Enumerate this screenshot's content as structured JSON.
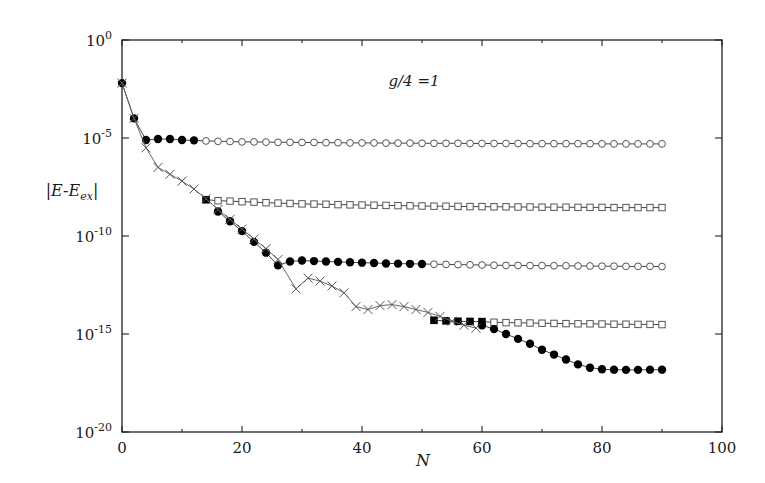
{
  "chart_data": {
    "type": "scatter",
    "title": "",
    "xlabel": "N",
    "ylabel": "|E-E_ex|",
    "ylabel_parts": {
      "main": "|E-E",
      "sub": "ex",
      "end": "|"
    },
    "annotation": "g/4 =1",
    "yscale": "log",
    "xlim": [
      0,
      100
    ],
    "ylim": [
      1e-20,
      1
    ],
    "x_ticks": [
      0,
      20,
      40,
      60,
      80,
      100
    ],
    "x_tick_labels": [
      "0",
      "20",
      "40",
      "60",
      "80",
      "100"
    ],
    "y_ticks_log10": [
      0,
      -5,
      -10,
      -15,
      -20
    ],
    "y_tick_labels": [
      {
        "base": "10",
        "exp": "0"
      },
      {
        "base": "10",
        "exp": "-5"
      },
      {
        "base": "10",
        "exp": "-10"
      },
      {
        "base": "10",
        "exp": "-15"
      },
      {
        "base": "10",
        "exp": "-20"
      }
    ],
    "grid": false,
    "legend": "none",
    "series": [
      {
        "name": "branch-1 (circles, plateau ~1e-5)",
        "marker": "circle",
        "line": true,
        "points_log10": [
          [
            0,
            -2.2,
            "filled"
          ],
          [
            2,
            -4.0,
            "filled"
          ],
          [
            4,
            -5.1,
            "filled"
          ],
          [
            6,
            -5.05,
            "filled"
          ],
          [
            8,
            -5.05,
            "filled"
          ],
          [
            10,
            -5.1,
            "filled"
          ],
          [
            12,
            -5.12,
            "filled"
          ],
          [
            14,
            -5.15,
            "open"
          ],
          [
            16,
            -5.17,
            "open"
          ],
          [
            18,
            -5.18,
            "open"
          ],
          [
            20,
            -5.2,
            "open"
          ],
          [
            22,
            -5.2,
            "open"
          ],
          [
            24,
            -5.21,
            "open"
          ],
          [
            26,
            -5.22,
            "open"
          ],
          [
            28,
            -5.22,
            "open"
          ],
          [
            30,
            -5.23,
            "open"
          ],
          [
            32,
            -5.23,
            "open"
          ],
          [
            34,
            -5.24,
            "open"
          ],
          [
            36,
            -5.24,
            "open"
          ],
          [
            38,
            -5.25,
            "open"
          ],
          [
            40,
            -5.25,
            "open"
          ],
          [
            42,
            -5.25,
            "open"
          ],
          [
            44,
            -5.26,
            "open"
          ],
          [
            46,
            -5.26,
            "open"
          ],
          [
            48,
            -5.26,
            "open"
          ],
          [
            50,
            -5.27,
            "open"
          ],
          [
            52,
            -5.27,
            "open"
          ],
          [
            54,
            -5.27,
            "open"
          ],
          [
            56,
            -5.27,
            "open"
          ],
          [
            58,
            -5.28,
            "open"
          ],
          [
            60,
            -5.28,
            "open"
          ],
          [
            62,
            -5.28,
            "open"
          ],
          [
            64,
            -5.28,
            "open"
          ],
          [
            66,
            -5.28,
            "open"
          ],
          [
            68,
            -5.29,
            "open"
          ],
          [
            70,
            -5.29,
            "open"
          ],
          [
            72,
            -5.29,
            "open"
          ],
          [
            74,
            -5.29,
            "open"
          ],
          [
            76,
            -5.29,
            "open"
          ],
          [
            78,
            -5.29,
            "open"
          ],
          [
            80,
            -5.3,
            "open"
          ],
          [
            82,
            -5.3,
            "open"
          ],
          [
            84,
            -5.3,
            "open"
          ],
          [
            86,
            -5.3,
            "open"
          ],
          [
            88,
            -5.3,
            "open"
          ],
          [
            90,
            -5.3,
            "open"
          ]
        ]
      },
      {
        "name": "branch-2 (squares, plateau ~1e-8)",
        "marker": "square",
        "line": true,
        "points_log10": [
          [
            14,
            -8.15,
            "filled"
          ],
          [
            16,
            -8.2,
            "open"
          ],
          [
            18,
            -8.22,
            "open"
          ],
          [
            20,
            -8.25,
            "open"
          ],
          [
            22,
            -8.27,
            "open"
          ],
          [
            24,
            -8.3,
            "open"
          ],
          [
            26,
            -8.32,
            "open"
          ],
          [
            28,
            -8.34,
            "open"
          ],
          [
            30,
            -8.36,
            "open"
          ],
          [
            32,
            -8.37,
            "open"
          ],
          [
            34,
            -8.38,
            "open"
          ],
          [
            36,
            -8.4,
            "open"
          ],
          [
            38,
            -8.41,
            "open"
          ],
          [
            40,
            -8.42,
            "open"
          ],
          [
            42,
            -8.43,
            "open"
          ],
          [
            44,
            -8.44,
            "open"
          ],
          [
            46,
            -8.45,
            "open"
          ],
          [
            48,
            -8.46,
            "open"
          ],
          [
            50,
            -8.47,
            "open"
          ],
          [
            52,
            -8.48,
            "open"
          ],
          [
            54,
            -8.48,
            "open"
          ],
          [
            56,
            -8.49,
            "open"
          ],
          [
            58,
            -8.5,
            "open"
          ],
          [
            60,
            -8.5,
            "open"
          ],
          [
            62,
            -8.51,
            "open"
          ],
          [
            64,
            -8.51,
            "open"
          ],
          [
            66,
            -8.52,
            "open"
          ],
          [
            68,
            -8.52,
            "open"
          ],
          [
            70,
            -8.53,
            "open"
          ],
          [
            72,
            -8.53,
            "open"
          ],
          [
            74,
            -8.53,
            "open"
          ],
          [
            76,
            -8.54,
            "open"
          ],
          [
            78,
            -8.54,
            "open"
          ],
          [
            80,
            -8.54,
            "open"
          ],
          [
            82,
            -8.55,
            "open"
          ],
          [
            84,
            -8.55,
            "open"
          ],
          [
            86,
            -8.55,
            "open"
          ],
          [
            88,
            -8.55,
            "open"
          ],
          [
            90,
            -8.55,
            "open"
          ]
        ]
      },
      {
        "name": "branch-3 (circles, plateau ~1e-11.5)",
        "marker": "circle",
        "line": true,
        "points_log10": [
          [
            16,
            -8.75,
            "filled"
          ],
          [
            18,
            -9.25,
            "filled"
          ],
          [
            20,
            -9.75,
            "filled"
          ],
          [
            22,
            -10.3,
            "filled"
          ],
          [
            24,
            -10.85,
            "filled"
          ],
          [
            26,
            -11.5,
            "filled"
          ],
          [
            28,
            -11.3,
            "filled"
          ],
          [
            30,
            -11.25,
            "filled"
          ],
          [
            32,
            -11.28,
            "filled"
          ],
          [
            34,
            -11.3,
            "filled"
          ],
          [
            36,
            -11.32,
            "filled"
          ],
          [
            38,
            -11.34,
            "filled"
          ],
          [
            40,
            -11.36,
            "filled"
          ],
          [
            42,
            -11.38,
            "filled"
          ],
          [
            44,
            -11.4,
            "filled"
          ],
          [
            46,
            -11.41,
            "filled"
          ],
          [
            48,
            -11.42,
            "filled"
          ],
          [
            50,
            -11.43,
            "filled"
          ],
          [
            52,
            -11.44,
            "open"
          ],
          [
            54,
            -11.45,
            "open"
          ],
          [
            56,
            -11.46,
            "open"
          ],
          [
            58,
            -11.47,
            "open"
          ],
          [
            60,
            -11.48,
            "open"
          ],
          [
            62,
            -11.49,
            "open"
          ],
          [
            64,
            -11.5,
            "open"
          ],
          [
            66,
            -11.5,
            "open"
          ],
          [
            68,
            -11.51,
            "open"
          ],
          [
            70,
            -11.51,
            "open"
          ],
          [
            72,
            -11.52,
            "open"
          ],
          [
            74,
            -11.52,
            "open"
          ],
          [
            76,
            -11.53,
            "open"
          ],
          [
            78,
            -11.53,
            "open"
          ],
          [
            80,
            -11.54,
            "open"
          ],
          [
            82,
            -11.54,
            "open"
          ],
          [
            84,
            -11.55,
            "open"
          ],
          [
            86,
            -11.55,
            "open"
          ],
          [
            88,
            -11.55,
            "open"
          ],
          [
            90,
            -11.56,
            "open"
          ]
        ]
      },
      {
        "name": "branch-4 (squares, plateau ~1e-14.5)",
        "marker": "square",
        "line": true,
        "points_log10": [
          [
            52,
            -14.3,
            "filled"
          ],
          [
            54,
            -14.33,
            "filled"
          ],
          [
            56,
            -14.35,
            "filled"
          ],
          [
            58,
            -14.36,
            "filled"
          ],
          [
            60,
            -14.37,
            "filled"
          ],
          [
            62,
            -14.4,
            "open"
          ],
          [
            64,
            -14.42,
            "open"
          ],
          [
            66,
            -14.43,
            "open"
          ],
          [
            68,
            -14.44,
            "open"
          ],
          [
            70,
            -14.45,
            "open"
          ],
          [
            72,
            -14.46,
            "open"
          ],
          [
            74,
            -14.47,
            "open"
          ],
          [
            76,
            -14.48,
            "open"
          ],
          [
            78,
            -14.48,
            "open"
          ],
          [
            80,
            -14.49,
            "open"
          ],
          [
            82,
            -14.5,
            "open"
          ],
          [
            84,
            -14.5,
            "open"
          ],
          [
            86,
            -14.51,
            "open"
          ],
          [
            88,
            -14.51,
            "open"
          ],
          [
            90,
            -14.52,
            "open"
          ]
        ]
      },
      {
        "name": "branch-5 (circles, converging ~1e-16.8)",
        "marker": "circle",
        "line": true,
        "points_log10": [
          [
            60,
            -14.55,
            "filled"
          ],
          [
            62,
            -14.75,
            "filled"
          ],
          [
            64,
            -15.0,
            "filled"
          ],
          [
            66,
            -15.25,
            "filled"
          ],
          [
            68,
            -15.5,
            "filled"
          ],
          [
            70,
            -15.8,
            "filled"
          ],
          [
            72,
            -16.05,
            "filled"
          ],
          [
            74,
            -16.3,
            "filled"
          ],
          [
            76,
            -16.55,
            "filled"
          ],
          [
            78,
            -16.72,
            "filled"
          ],
          [
            80,
            -16.8,
            "filled"
          ],
          [
            82,
            -16.82,
            "filled"
          ],
          [
            84,
            -16.83,
            "filled"
          ],
          [
            86,
            -16.83,
            "filled"
          ],
          [
            88,
            -16.82,
            "filled"
          ],
          [
            90,
            -16.82,
            "filled"
          ]
        ]
      },
      {
        "name": "exact-convergence (crosses)",
        "marker": "cross",
        "line": true,
        "points_log10": [
          [
            0,
            -2.2
          ],
          [
            2,
            -4.0
          ],
          [
            4,
            -5.5
          ],
          [
            6,
            -6.5
          ],
          [
            8,
            -6.85
          ],
          [
            10,
            -7.2
          ],
          [
            12,
            -7.6
          ],
          [
            14,
            -8.1
          ],
          [
            16,
            -8.65
          ],
          [
            18,
            -9.15
          ],
          [
            20,
            -9.65
          ],
          [
            22,
            -10.15
          ],
          [
            24,
            -10.65
          ],
          [
            26,
            -11.2
          ],
          [
            29,
            -12.7
          ],
          [
            31,
            -12.15
          ],
          [
            33,
            -12.3
          ],
          [
            35,
            -12.55
          ],
          [
            37,
            -12.9
          ],
          [
            39,
            -13.6
          ],
          [
            41,
            -13.75
          ],
          [
            43,
            -13.55
          ],
          [
            45,
            -13.5
          ],
          [
            47,
            -13.6
          ],
          [
            49,
            -13.75
          ],
          [
            51,
            -13.9
          ],
          [
            53,
            -14.1
          ],
          [
            55,
            -14.35
          ],
          [
            57,
            -14.55
          ],
          [
            59,
            -14.7
          ]
        ]
      }
    ]
  }
}
